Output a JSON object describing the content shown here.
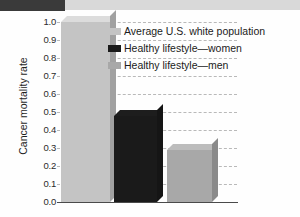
{
  "banner": {
    "dark_label": "",
    "light_label": ""
  },
  "chart_data": {
    "type": "bar",
    "title": "",
    "xlabel": "",
    "ylabel": "Cancer mortality rate",
    "ylim": [
      0.0,
      1.0
    ],
    "grid": true,
    "legend_position": "inside-top-right",
    "categories": [
      "Average U.S. white population",
      "Healthy lifestyle—women",
      "Healthy lifestyle—men"
    ],
    "values": [
      1.0,
      0.48,
      0.29
    ],
    "ytick_labels": [
      "1.0",
      "0.9",
      "0.8",
      "0.7",
      "0.6",
      "0.5",
      "0.4",
      "0.3",
      "0.2",
      "0.1",
      "0.0"
    ],
    "ytick_values": [
      1.0,
      0.9,
      0.8,
      0.7,
      0.6,
      0.5,
      0.4,
      0.3,
      0.2,
      0.1,
      0.0
    ],
    "colors": [
      "#c4c4c4",
      "#1a1a1a",
      "#a8a8a8"
    ],
    "legend": [
      {
        "label": "Average U.S. white population",
        "color": "#c4c4c4"
      },
      {
        "label": "Healthy lifestyle—women",
        "color": "#1a1a1a"
      },
      {
        "label": "Healthy lifestyle—men",
        "color": "#a8a8a8"
      }
    ]
  }
}
